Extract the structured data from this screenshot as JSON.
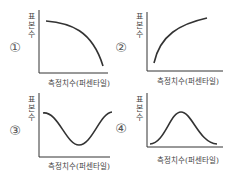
{
  "charts": [
    {
      "id": "1",
      "marker": "①",
      "ylabel": [
        "표",
        "본",
        "수"
      ],
      "xlabel": "측정치수(퍼센타일)",
      "shape": "decreasing concave"
    },
    {
      "id": "2",
      "marker": "②",
      "ylabel": [
        "표",
        "본",
        "수"
      ],
      "xlabel": "측정치수(퍼센타일)",
      "shape": "increasing concave"
    },
    {
      "id": "3",
      "marker": "③",
      "ylabel": [
        "표",
        "본",
        "수"
      ],
      "xlabel": "측정치수(퍼센타일)",
      "shape": "U-shaped (inverted bell)"
    },
    {
      "id": "4",
      "marker": "④",
      "ylabel": [
        "표",
        "본",
        "수"
      ],
      "xlabel": "측정치수(퍼센타일)",
      "shape": "bell-shaped (normal)"
    }
  ],
  "colors": {
    "axis": "#333333",
    "curve": "#333333"
  }
}
